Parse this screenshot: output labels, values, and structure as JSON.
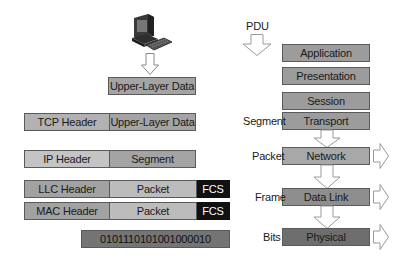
{
  "left_stack": {
    "computer_icon": "computer-icon",
    "upper_layer": {
      "label": "Upper-Layer Data"
    },
    "tcp_row": {
      "header": "TCP Header",
      "payload": "Upper-Layer Data"
    },
    "ip_row": {
      "header": "IP Header",
      "payload": "Segment"
    },
    "llc_row": {
      "header": "LLC Header",
      "payload": "Packet",
      "trailer": "FCS"
    },
    "mac_row": {
      "header": "MAC Header",
      "payload": "Packet",
      "trailer": "FCS"
    },
    "bits_row": {
      "value": "0101110101001000010"
    }
  },
  "right_stack": {
    "pdu_label": "PDU",
    "layers": [
      {
        "name": "Application",
        "pdu": "",
        "color": "#9a9a9a"
      },
      {
        "name": "Presentation",
        "pdu": "",
        "color": "#9a9a9a"
      },
      {
        "name": "Session",
        "pdu": "",
        "color": "#9a9a9a"
      },
      {
        "name": "Transport",
        "pdu": "Segment",
        "color": "#9a9a9a"
      },
      {
        "name": "Network",
        "pdu": "Packet",
        "color": "#a8a8a8"
      },
      {
        "name": "Data Link",
        "pdu": "Frame",
        "color": "#8c8c8c"
      },
      {
        "name": "Physical",
        "pdu": "Bits",
        "color": "#6e6e6e"
      }
    ]
  },
  "colors": {
    "light_fill": "#b4b4b4",
    "mid_fill": "#9a9a9a",
    "dark_fill": "#6e6e6e",
    "fcs_fill": "#111111",
    "border": "#5a5a5a"
  }
}
